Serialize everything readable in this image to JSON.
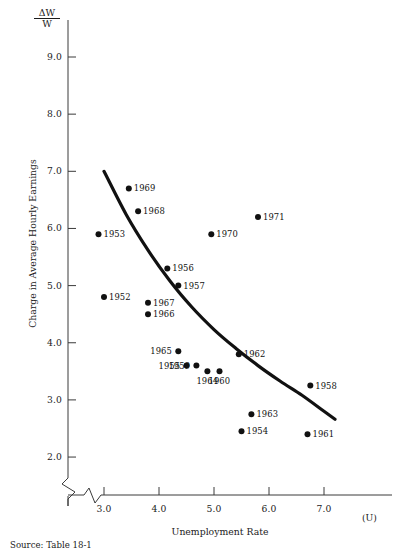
{
  "figure": {
    "source_note": "Source: Table 18-1",
    "y_axis": {
      "symbol_numerator": "ΔW",
      "symbol_denominator": "W",
      "title": "Charge in Average Hourly Earnings",
      "ticks": [
        "9.0",
        "8.0",
        "7.0",
        "6.0",
        "5.0",
        "4.0",
        "3.0",
        "2.0"
      ],
      "has_break": true
    },
    "x_axis": {
      "title": "Unemployment Rate",
      "variable_symbol": "(U)",
      "ticks": [
        "3.0",
        "4.0",
        "5.0",
        "6.0",
        "7.0"
      ],
      "has_break": true
    }
  },
  "chart_data": {
    "type": "scatter",
    "title": "",
    "subtitle": "",
    "xlabel": "Unemployment Rate",
    "ylabel": "Charge in Average Hourly Earnings",
    "x_symbol": "(U)",
    "y_symbol": "ΔW/W",
    "xlim": [
      2.6,
      7.6
    ],
    "ylim": [
      1.8,
      9.4
    ],
    "xticks": [
      3.0,
      4.0,
      5.0,
      6.0,
      7.0
    ],
    "yticks": [
      2.0,
      3.0,
      4.0,
      5.0,
      6.0,
      7.0,
      8.0,
      9.0
    ],
    "grid": false,
    "legend": "none",
    "axis_breaks": {
      "x": true,
      "y": true
    },
    "point_labels_are_years": true,
    "points": [
      {
        "label": "1969",
        "x": 3.45,
        "y": 6.7,
        "label_pos": "right"
      },
      {
        "label": "1968",
        "x": 3.62,
        "y": 6.3,
        "label_pos": "right"
      },
      {
        "label": "1953",
        "x": 2.9,
        "y": 5.9,
        "label_pos": "right"
      },
      {
        "label": "1970",
        "x": 4.95,
        "y": 5.9,
        "label_pos": "right"
      },
      {
        "label": "1971",
        "x": 5.8,
        "y": 6.2,
        "label_pos": "right"
      },
      {
        "label": "1956",
        "x": 4.15,
        "y": 5.3,
        "label_pos": "right"
      },
      {
        "label": "1957",
        "x": 4.35,
        "y": 5.0,
        "label_pos": "right"
      },
      {
        "label": "1952",
        "x": 3.0,
        "y": 4.8,
        "label_pos": "right"
      },
      {
        "label": "1967",
        "x": 3.8,
        "y": 4.7,
        "label_pos": "right"
      },
      {
        "label": "1966",
        "x": 3.8,
        "y": 4.5,
        "label_pos": "right"
      },
      {
        "label": "1965",
        "x": 4.35,
        "y": 3.85,
        "label_pos": "left"
      },
      {
        "label": "1955",
        "x": 4.5,
        "y": 3.6,
        "label_pos": "left"
      },
      {
        "label": "1959",
        "x": 4.68,
        "y": 3.6,
        "label_pos": "left"
      },
      {
        "label": "1964",
        "x": 4.88,
        "y": 3.5,
        "label_pos": "below"
      },
      {
        "label": "1960",
        "x": 5.1,
        "y": 3.5,
        "label_pos": "below"
      },
      {
        "label": "1962",
        "x": 5.45,
        "y": 3.8,
        "label_pos": "right"
      },
      {
        "label": "1963",
        "x": 5.68,
        "y": 2.75,
        "label_pos": "right"
      },
      {
        "label": "1954",
        "x": 5.5,
        "y": 2.45,
        "label_pos": "right"
      },
      {
        "label": "1958",
        "x": 6.75,
        "y": 3.25,
        "label_pos": "right"
      },
      {
        "label": "1961",
        "x": 6.7,
        "y": 2.4,
        "label_pos": "right"
      }
    ],
    "fitted_curve": {
      "name": "Phillips curve",
      "style": "solid-thick",
      "color": "#111111",
      "x": [
        3.0,
        3.4,
        3.8,
        4.2,
        4.6,
        5.0,
        5.4,
        5.8,
        6.2,
        6.6,
        7.0,
        7.2
      ],
      "y": [
        7.0,
        6.25,
        5.62,
        5.08,
        4.62,
        4.23,
        3.9,
        3.6,
        3.33,
        3.08,
        2.8,
        2.66
      ]
    },
    "colors": {
      "point": "#111111",
      "curve": "#111111",
      "axis": "#3a3a3a"
    }
  }
}
